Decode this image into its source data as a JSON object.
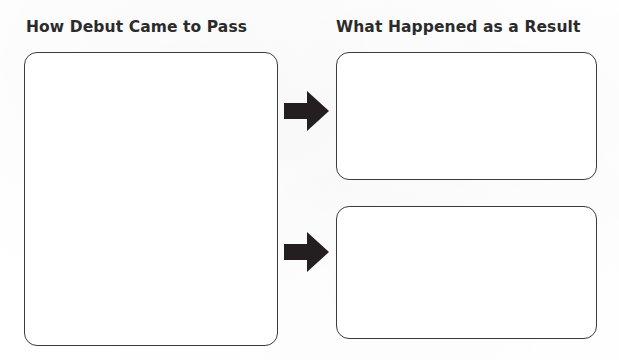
{
  "worksheet": {
    "columns": [
      {
        "heading": "How Debut Came to Pass",
        "box_count": 1
      },
      {
        "heading": "What Happened as a Result",
        "box_count": 2
      }
    ],
    "boxes": {
      "cause": {
        "content": ""
      },
      "effect_1": {
        "content": ""
      },
      "effect_2": {
        "content": ""
      }
    },
    "arrows": [
      {
        "name": "arrow-to-effect-1",
        "direction": "right",
        "color": "#231f20"
      },
      {
        "name": "arrow-to-effect-2",
        "direction": "right",
        "color": "#231f20"
      }
    ],
    "colors": {
      "page_background": "#ffffff",
      "box_fill": "#ffffff",
      "box_border": "#3b3b3b",
      "heading_text": "#2b2b2b",
      "arrow_fill": "#231f20"
    }
  }
}
